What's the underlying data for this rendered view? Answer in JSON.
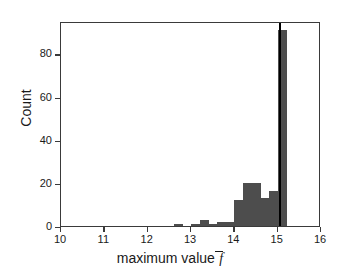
{
  "chart_data": {
    "type": "bar",
    "title": "",
    "subtitle": "",
    "xlabel": "maximum value",
    "xlabel_symbol": "f",
    "xlabel_symbol_overbar": true,
    "ylabel": "Count",
    "xlim": [
      10,
      16
    ],
    "ylim": [
      0,
      95
    ],
    "grid": false,
    "legend": null,
    "bin_width": 0.2,
    "bar_color": "#4d4d4d",
    "xticks": [
      10,
      11,
      12,
      13,
      14,
      15,
      16
    ],
    "xticklabels": [
      "10",
      "11",
      "12",
      "13",
      "14",
      "15",
      "16"
    ],
    "yticks": [
      0,
      20,
      40,
      60,
      80
    ],
    "yticklabels": [
      "0",
      "20",
      "40",
      "60",
      "80"
    ],
    "bins": [
      {
        "x0": 12.6,
        "x1": 12.8,
        "count": 1
      },
      {
        "x0": 13.0,
        "x1": 13.2,
        "count": 1
      },
      {
        "x0": 13.2,
        "x1": 13.4,
        "count": 3
      },
      {
        "x0": 13.4,
        "x1": 13.6,
        "count": 1
      },
      {
        "x0": 13.6,
        "x1": 13.8,
        "count": 2
      },
      {
        "x0": 13.8,
        "x1": 14.0,
        "count": 2
      },
      {
        "x0": 14.0,
        "x1": 14.2,
        "count": 12
      },
      {
        "x0": 14.2,
        "x1": 14.4,
        "count": 20
      },
      {
        "x0": 14.4,
        "x1": 14.6,
        "count": 20
      },
      {
        "x0": 14.6,
        "x1": 14.8,
        "count": 13
      },
      {
        "x0": 14.8,
        "x1": 15.0,
        "count": 16
      },
      {
        "x0": 15.0,
        "x1": 15.2,
        "count": 91
      }
    ],
    "annotations": [
      {
        "type": "vertical-line",
        "x": 15.05,
        "color": "#000000",
        "linewidth": 2
      }
    ]
  }
}
